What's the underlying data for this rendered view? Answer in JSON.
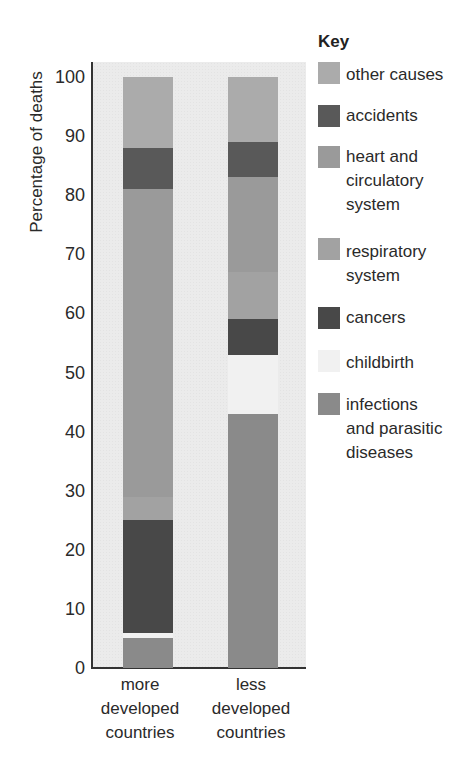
{
  "chart_data": {
    "type": "bar",
    "stacked": true,
    "title": "",
    "xlabel": "",
    "ylabel": "Percentage of deaths",
    "ylim": [
      0,
      100
    ],
    "yticks": [
      0,
      10,
      20,
      30,
      40,
      50,
      60,
      70,
      80,
      90,
      100
    ],
    "grid": false,
    "legend_position": "right",
    "legend_title": "Key",
    "categories": [
      "more developed countries",
      "less developed countries"
    ],
    "series": [
      {
        "name": "infections and parasitic diseases",
        "color": "#8a8a8a",
        "values": [
          5,
          43
        ]
      },
      {
        "name": "childbirth",
        "color": "#f1f1f1",
        "values": [
          1,
          10
        ]
      },
      {
        "name": "cancers",
        "color": "#484848",
        "values": [
          19,
          6
        ]
      },
      {
        "name": "respiratory system",
        "color": "#a2a2a2",
        "values": [
          4,
          8
        ]
      },
      {
        "name": "heart and circulatory system",
        "color": "#9a9a9a",
        "values": [
          52,
          16
        ]
      },
      {
        "name": "accidents",
        "color": "#595959",
        "values": [
          7,
          6
        ]
      },
      {
        "name": "other causes",
        "color": "#ababab",
        "values": [
          12,
          11
        ]
      }
    ]
  },
  "axis": {
    "y_title": "Percentage of deaths",
    "x_labels": [
      "more\ndeveloped\ncountries",
      "less\ndeveloped\ncountries"
    ]
  },
  "legend": {
    "title": "Key",
    "items": [
      {
        "label": "other causes",
        "color": "#ababab"
      },
      {
        "label": "accidents",
        "color": "#595959"
      },
      {
        "label": "heart and\ncirculatory\nsystem",
        "color": "#9a9a9a"
      },
      {
        "label": "respiratory\nsystem",
        "color": "#a2a2a2"
      },
      {
        "label": "cancers",
        "color": "#484848"
      },
      {
        "label": "childbirth",
        "color": "#f1f1f1"
      },
      {
        "label": "infections\nand parasitic\ndiseases",
        "color": "#8a8a8a"
      }
    ]
  }
}
